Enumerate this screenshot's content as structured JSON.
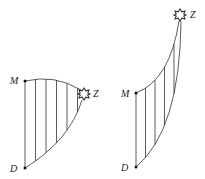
{
  "diagrams": [
    {
      "name": "left",
      "labels": {
        "top": "M",
        "bottom": "D",
        "star": "Z"
      },
      "hatch_lines": 5
    },
    {
      "name": "right",
      "labels": {
        "top": "M",
        "bottom": "D",
        "star": "Z"
      },
      "hatch_lines": 4
    }
  ],
  "colors": {
    "stroke": "#333333",
    "text": "#222222"
  }
}
